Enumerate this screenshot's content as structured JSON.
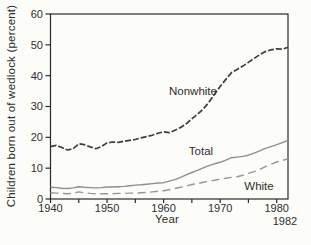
{
  "figure": {
    "y_axis_title": "Children born out of wedlock (percent)",
    "x_axis_title": "Year",
    "end_x_annotation": "1982"
  },
  "chart_data": {
    "type": "line",
    "title": "",
    "xlabel": "Year",
    "ylabel": "Children born out of wedlock (percent)",
    "xlim": [
      1940,
      1982
    ],
    "ylim": [
      0,
      60
    ],
    "y_ticks": [
      0,
      10,
      20,
      30,
      40,
      50,
      60
    ],
    "x_major_ticks": [
      1940,
      1950,
      1960,
      1970,
      1980
    ],
    "x_minor_ticks": [
      1945,
      1955,
      1965,
      1975
    ],
    "grid": false,
    "legend_position": "inline-labels",
    "frame": "full-box",
    "axis_color": "#2a2a2a",
    "x": [
      1940,
      1941,
      1942,
      1943,
      1944,
      1945,
      1946,
      1947,
      1948,
      1949,
      1950,
      1951,
      1952,
      1953,
      1954,
      1955,
      1956,
      1957,
      1958,
      1959,
      1960,
      1961,
      1962,
      1963,
      1964,
      1965,
      1966,
      1967,
      1968,
      1969,
      1970,
      1971,
      1972,
      1973,
      1974,
      1975,
      1976,
      1977,
      1978,
      1979,
      1980,
      1981,
      1982
    ],
    "series": [
      {
        "name": "Nonwhite",
        "color": "#3d3d3d",
        "dash": "6 2",
        "width": 1.7,
        "values": [
          17.0,
          17.4,
          16.7,
          15.9,
          16.3,
          17.9,
          17.6,
          16.9,
          16.3,
          17.0,
          18.2,
          18.5,
          18.4,
          18.7,
          19.0,
          19.3,
          19.8,
          20.2,
          20.7,
          21.3,
          21.8,
          21.5,
          22.3,
          23.2,
          24.4,
          26.0,
          27.5,
          29.2,
          31.3,
          34.0,
          36.5,
          38.8,
          41.0,
          42.0,
          43.1,
          44.3,
          45.6,
          46.8,
          47.8,
          48.4,
          48.7,
          48.6,
          49.2
        ]
      },
      {
        "name": "Total",
        "color": "#8f8f8f",
        "dash": null,
        "width": 1.4,
        "values": [
          3.8,
          3.7,
          3.5,
          3.4,
          3.6,
          4.0,
          3.8,
          3.7,
          3.6,
          3.7,
          3.9,
          3.9,
          4.0,
          4.1,
          4.3,
          4.5,
          4.6,
          4.8,
          5.0,
          5.2,
          5.3,
          5.8,
          6.3,
          7.0,
          7.8,
          8.6,
          9.3,
          10.1,
          10.8,
          11.4,
          11.9,
          12.6,
          13.4,
          13.6,
          13.8,
          14.2,
          14.9,
          15.6,
          16.4,
          17.0,
          17.6,
          18.3,
          19.0
        ]
      },
      {
        "name": "White",
        "color": "#979797",
        "dash": "8 4.5",
        "width": 1.4,
        "values": [
          2.0,
          1.9,
          1.8,
          1.7,
          1.8,
          2.3,
          2.0,
          1.8,
          1.7,
          1.7,
          1.7,
          1.7,
          1.8,
          1.8,
          1.9,
          1.9,
          2.0,
          2.1,
          2.3,
          2.5,
          2.7,
          3.0,
          3.4,
          3.8,
          4.2,
          4.7,
          5.0,
          5.4,
          5.7,
          6.1,
          6.4,
          6.7,
          7.0,
          7.2,
          7.7,
          8.3,
          8.9,
          9.6,
          10.5,
          11.3,
          12.0,
          12.5,
          13.0
        ]
      }
    ]
  }
}
